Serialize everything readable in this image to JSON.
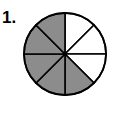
{
  "problem": {
    "number_label": "1."
  },
  "fraction_circle": {
    "total_parts": 8,
    "shaded_parts": 5,
    "unshaded_parts": 3,
    "shaded_color": "#8c8c8c",
    "unshaded_color": "#ffffff",
    "outline_color": "#000000",
    "slices": [
      {
        "index": 0,
        "position": "top-right-upper",
        "shaded": false
      },
      {
        "index": 1,
        "position": "top-right-lower",
        "shaded": false
      },
      {
        "index": 2,
        "position": "bottom-right-upper",
        "shaded": false
      },
      {
        "index": 3,
        "position": "bottom-right-lower",
        "shaded": true
      },
      {
        "index": 4,
        "position": "bottom-left-lower",
        "shaded": true
      },
      {
        "index": 5,
        "position": "bottom-left-upper",
        "shaded": true
      },
      {
        "index": 6,
        "position": "top-left-lower",
        "shaded": true
      },
      {
        "index": 7,
        "position": "top-left-upper",
        "shaded": true
      }
    ]
  }
}
